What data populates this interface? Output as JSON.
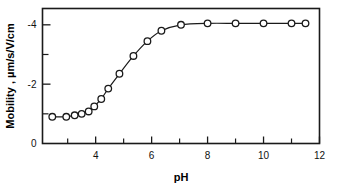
{
  "chart_data": {
    "type": "line",
    "title": "",
    "subtitle": "",
    "xlabel": "pH",
    "ylabel": "Mobility , µm/s/V/cm",
    "xlim": [
      2.1,
      12.0
    ],
    "ylim": [
      0,
      -4.55
    ],
    "grid": false,
    "legend": null,
    "xticks_major": [
      4,
      6,
      8,
      10,
      12
    ],
    "xticks_major_labels": [
      "4",
      "6",
      "8",
      "10",
      "12"
    ],
    "xticks_minor": [
      3,
      5,
      7,
      9,
      11
    ],
    "yticks_major": [
      0,
      -2,
      -4
    ],
    "yticks_major_labels": [
      "0",
      "-2",
      "-4"
    ],
    "yticks_minor": [
      -1,
      -3
    ],
    "marker": "open-circle",
    "series": [
      {
        "name": "mobility",
        "x": [
          2.45,
          2.95,
          3.25,
          3.5,
          3.75,
          3.95,
          4.2,
          4.45,
          4.85,
          5.35,
          5.85,
          6.35,
          7.05,
          8.0,
          9.0,
          10.0,
          11.0,
          11.5
        ],
        "y": [
          -0.9,
          -0.9,
          -0.95,
          -1.0,
          -1.08,
          -1.25,
          -1.5,
          -1.85,
          -2.35,
          -2.95,
          -3.45,
          -3.8,
          -4.0,
          -4.05,
          -4.05,
          -4.05,
          -4.05,
          -4.05
        ]
      }
    ]
  },
  "axis_labels": {
    "y_title": "Mobility , µm/s/V/cm",
    "x_title": "pH"
  },
  "colors": {
    "line": "#1a1a1a",
    "marker_fill": "#ffffff",
    "axis": "#1a1a1a",
    "background": "#ffffff"
  }
}
